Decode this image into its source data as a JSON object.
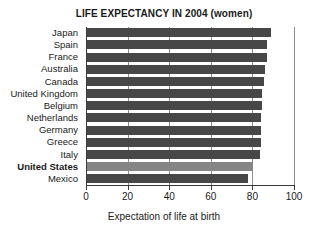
{
  "chart_data": {
    "type": "bar",
    "orientation": "horizontal",
    "title": "LIFE EXPECTANCY IN 2004 (women)",
    "xlabel": "Expectation of life at birth",
    "ylabel": "",
    "xlim": [
      0,
      100
    ],
    "xticks": [
      0,
      20,
      40,
      60,
      80,
      100
    ],
    "xtick_labels": [
      "0",
      "20",
      "40",
      "60",
      "80",
      "100"
    ],
    "grid": true,
    "legend": null,
    "categories": [
      "Japan",
      "Spain",
      "France",
      "Australia",
      "Canada",
      "United Kingdom",
      "Belgium",
      "Netherlands",
      "Germany",
      "Greece",
      "Italy",
      "United States",
      "Mexico"
    ],
    "values": [
      89,
      87,
      87,
      86,
      85.5,
      84.5,
      84.5,
      84,
      84,
      84,
      83.5,
      80.5,
      78
    ],
    "highlight_category": "United States",
    "colors": {
      "bar": "#474747",
      "bar_highlight": "#868686",
      "axis": "#3c3c3c",
      "grid": "#8d8d8d",
      "text": "#1a1a1a",
      "background": "#ffffff"
    }
  }
}
